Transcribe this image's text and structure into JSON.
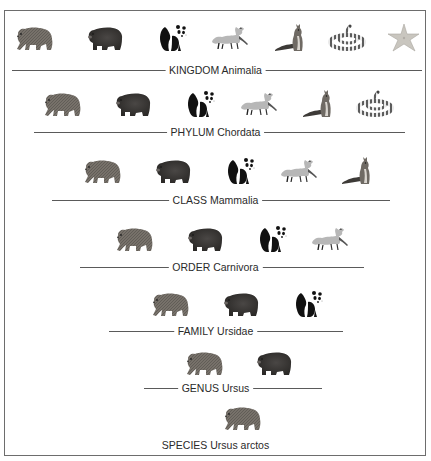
{
  "diagram": {
    "type": "taxonomic-hierarchy",
    "frame_color": "#6d6d6d",
    "line_color": "#5a5a5a",
    "text_color": "#2a2a2a"
  },
  "animal_types": {
    "brown-bear": {
      "label": "brown bear",
      "color": "#6f6a62"
    },
    "black-bear": {
      "label": "dark bear",
      "color": "#3c3a38"
    },
    "panda": {
      "label": "giant panda",
      "color": "#111111"
    },
    "fox": {
      "label": "fox",
      "color": "#b5b5b5"
    },
    "squirrel": {
      "label": "squirrel",
      "color": "#5a5550"
    },
    "snake": {
      "label": "coiled snake",
      "color": "#777777"
    },
    "starfish": {
      "label": "starfish",
      "color": "#c7c4bd"
    }
  },
  "ranks": [
    {
      "rank": "KINGDOM",
      "taxon": "Animalia",
      "label": "KINGDOM Animalia",
      "label_y": 70,
      "line": {
        "x1": 12,
        "x2": 422
      },
      "animals_y": 22,
      "animals": [
        {
          "type": "brown-bear",
          "x": 14
        },
        {
          "type": "black-bear",
          "x": 84
        },
        {
          "type": "panda",
          "x": 153
        },
        {
          "type": "fox",
          "x": 209
        },
        {
          "type": "squirrel",
          "x": 272
        },
        {
          "type": "snake",
          "x": 326
        },
        {
          "type": "starfish",
          "x": 382
        }
      ]
    },
    {
      "rank": "PHYLUM",
      "taxon": "Chordata",
      "label": "PHYLUM Chordata",
      "label_y": 132,
      "line": {
        "x1": 34,
        "x2": 405
      },
      "animals_y": 88,
      "animals": [
        {
          "type": "brown-bear",
          "x": 42
        },
        {
          "type": "black-bear",
          "x": 112
        },
        {
          "type": "panda",
          "x": 181
        },
        {
          "type": "fox",
          "x": 238
        },
        {
          "type": "squirrel",
          "x": 300
        },
        {
          "type": "snake",
          "x": 354
        }
      ]
    },
    {
      "rank": "CLASS",
      "taxon": "Mammalia",
      "label": "CLASS Mammalia",
      "label_y": 200,
      "line": {
        "x1": 52,
        "x2": 390
      },
      "animals_y": 155,
      "animals": [
        {
          "type": "brown-bear",
          "x": 82
        },
        {
          "type": "black-bear",
          "x": 152
        },
        {
          "type": "panda",
          "x": 221
        },
        {
          "type": "fox",
          "x": 278
        },
        {
          "type": "squirrel",
          "x": 339
        }
      ]
    },
    {
      "rank": "ORDER",
      "taxon": "Carnivora",
      "label": "ORDER Carnivora",
      "label_y": 267,
      "line": {
        "x1": 80,
        "x2": 364
      },
      "animals_y": 223,
      "animals": [
        {
          "type": "brown-bear",
          "x": 114
        },
        {
          "type": "black-bear",
          "x": 184
        },
        {
          "type": "panda",
          "x": 253
        },
        {
          "type": "fox",
          "x": 309
        }
      ]
    },
    {
      "rank": "FAMILY",
      "taxon": "Ursidae",
      "label": "FAMILY Ursidae",
      "label_y": 331,
      "line": {
        "x1": 109,
        "x2": 343
      },
      "animals_y": 288,
      "animals": [
        {
          "type": "brown-bear",
          "x": 150
        },
        {
          "type": "black-bear",
          "x": 220
        },
        {
          "type": "panda",
          "x": 289
        }
      ]
    },
    {
      "rank": "GENUS",
      "taxon": "Ursus",
      "label": "GENUS Ursus",
      "label_y": 388,
      "line": {
        "x1": 144,
        "x2": 322
      },
      "animals_y": 347,
      "animals": [
        {
          "type": "brown-bear",
          "x": 184
        },
        {
          "type": "black-bear",
          "x": 253
        }
      ]
    },
    {
      "rank": "SPECIES",
      "taxon": "Ursus arctos",
      "label": "SPECIES Ursus arctos",
      "label_y": 445,
      "line": null,
      "animals_y": 402,
      "animals": [
        {
          "type": "brown-bear",
          "x": 222
        }
      ]
    }
  ]
}
